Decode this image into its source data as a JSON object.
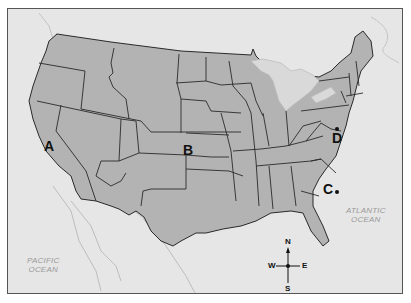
{
  "map": {
    "title": "Map of the United States",
    "colors": {
      "land": "#b3b3b3",
      "water": "#e6e6e6",
      "border": "#2a2a2a",
      "lakes": "#d9d9d9"
    },
    "markers": [
      {
        "id": "A",
        "label": "A",
        "dot": false
      },
      {
        "id": "B",
        "label": "B",
        "dot": false
      },
      {
        "id": "C",
        "label": "C",
        "dot": true
      },
      {
        "id": "D",
        "label": "D",
        "dot": true
      }
    ],
    "oceans": [
      {
        "name_line1": "PACIFIC",
        "name_line2": "OCEAN"
      },
      {
        "name_line1": "ATLANTIC",
        "name_line2": "OCEAN"
      }
    ],
    "compass": {
      "north": "N",
      "south": "S",
      "east": "E",
      "west": "W"
    }
  }
}
